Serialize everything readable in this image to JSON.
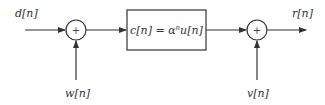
{
  "diagram": {
    "type": "block-diagram",
    "inputs": {
      "d": "d[n]",
      "w": "w[n]",
      "v": "v[n]"
    },
    "output": "r[n]",
    "junction1": {
      "symbol": "+"
    },
    "junction2": {
      "symbol": "+"
    },
    "block": {
      "lhs": "c[n] = ",
      "base": "α",
      "exp": "n",
      "rhs": "u[n]"
    },
    "colors": {
      "stroke": "#333333",
      "background": "#ffffff"
    }
  }
}
